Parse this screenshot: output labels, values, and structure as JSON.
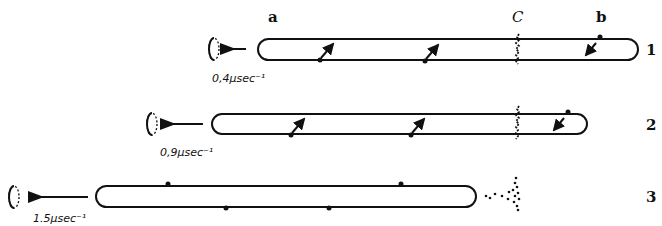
{
  "labels": {
    "end_a": "a",
    "cleavage_c": "C",
    "end_b": "b"
  },
  "rows": [
    {
      "number": "1",
      "speed": "0,4µsec⁻¹"
    },
    {
      "number": "2",
      "speed": "0,9µsec⁻¹"
    },
    {
      "number": "3",
      "speed": "1.5µsec⁻¹"
    }
  ],
  "colors": {
    "ink": "#111111",
    "background": "#ffffff"
  }
}
